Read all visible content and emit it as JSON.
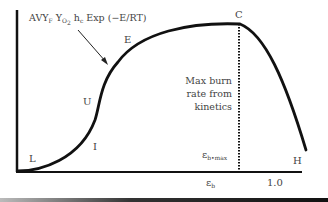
{
  "diagram": {
    "formula": {
      "prefix": "AVY",
      "sub_F": "F",
      "y": " Y",
      "sub_O2": "O",
      "sub_2": "2",
      "h": " h",
      "sub_c": "c",
      "suffix": " Exp (−E/RT)"
    },
    "point_labels": {
      "L": "L",
      "I": "I",
      "U": "U",
      "E": "E",
      "C": "C",
      "H": "H"
    },
    "note_lines": [
      "Max burn",
      "rate from",
      "kinetics"
    ],
    "eps_max_label": "ε",
    "eps_max_sub": "b•max",
    "x_axis": {
      "eps_b": "ε",
      "eps_b_sub": "b",
      "one": "1.0"
    },
    "colors": {
      "curve": "#111111",
      "axis": "#111111",
      "text": "#444444"
    }
  }
}
